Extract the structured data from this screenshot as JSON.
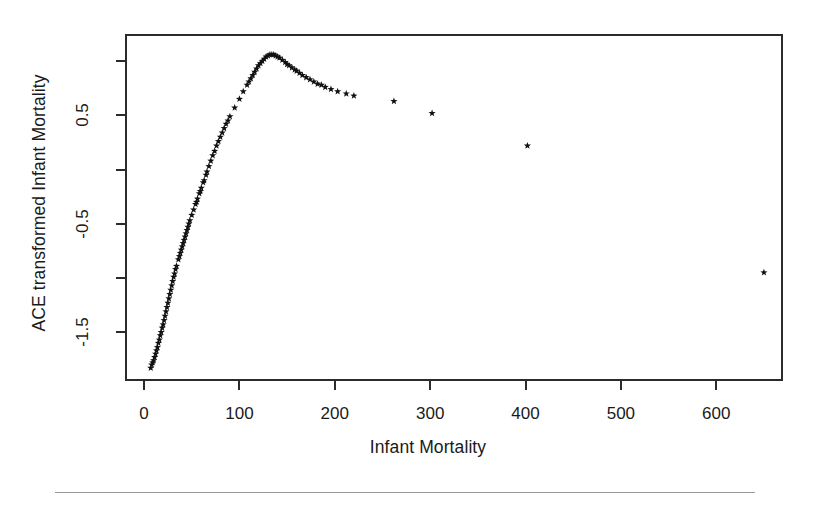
{
  "figure": {
    "background_color": "#ffffff",
    "foreground_color": "#1a1a1a",
    "marker_color": "#111111",
    "footer_rule_color": "#9a9a9a"
  },
  "chart_data": {
    "type": "scatter",
    "title": "",
    "xlabel": "Infant Mortality",
    "ylabel": "ACE transformed Infant Mortality",
    "xlim": [
      -20,
      670
    ],
    "ylim": [
      -1.95,
      1.25
    ],
    "xticks": [
      0,
      100,
      200,
      300,
      400,
      500,
      600
    ],
    "xticklabels": [
      "0",
      "100",
      "200",
      "300",
      "400",
      "500",
      "600"
    ],
    "yticks": [
      -1.5,
      -0.5,
      0.5
    ],
    "yticklabels": [
      "-1.5",
      "-0.5",
      "0.5"
    ],
    "yticks_minor": [
      -1.0,
      0.0,
      1.0
    ],
    "grid": false,
    "legend": null,
    "marker": "star",
    "marker_size": 6,
    "series": [
      {
        "name": "ACE transformed Infant Mortality",
        "x": [
          7,
          8,
          9,
          10,
          11,
          12,
          13,
          14,
          15,
          16,
          17,
          18,
          19,
          20,
          21,
          22,
          23,
          24,
          25,
          26,
          27,
          28,
          29,
          30,
          31,
          32,
          33,
          34,
          36,
          37,
          38,
          39,
          40,
          41,
          42,
          43,
          44,
          45,
          46,
          47,
          48,
          50,
          52,
          54,
          55,
          56,
          58,
          59,
          60,
          62,
          63,
          65,
          66,
          68,
          70,
          72,
          74,
          76,
          78,
          80,
          82,
          84,
          86,
          88,
          90,
          95,
          100,
          104,
          108,
          110,
          112,
          114,
          116,
          118,
          120,
          122,
          124,
          126,
          128,
          130,
          132,
          134,
          136,
          138,
          140,
          142,
          145,
          148,
          150,
          152,
          155,
          158,
          160,
          163,
          166,
          170,
          174,
          178,
          182,
          186,
          190,
          196,
          203,
          212,
          220,
          262,
          302,
          402,
          650
        ],
        "y": [
          -1.83,
          -1.8,
          -1.78,
          -1.76,
          -1.73,
          -1.7,
          -1.67,
          -1.64,
          -1.6,
          -1.57,
          -1.53,
          -1.5,
          -1.46,
          -1.43,
          -1.39,
          -1.35,
          -1.31,
          -1.27,
          -1.23,
          -1.19,
          -1.15,
          -1.11,
          -1.07,
          -1.03,
          -0.99,
          -0.96,
          -0.92,
          -0.89,
          -0.83,
          -0.8,
          -0.77,
          -0.74,
          -0.71,
          -0.68,
          -0.65,
          -0.62,
          -0.59,
          -0.56,
          -0.53,
          -0.5,
          -0.47,
          -0.42,
          -0.37,
          -0.32,
          -0.3,
          -0.27,
          -0.22,
          -0.2,
          -0.17,
          -0.12,
          -0.1,
          -0.05,
          -0.02,
          0.03,
          0.08,
          0.13,
          0.17,
          0.22,
          0.26,
          0.3,
          0.34,
          0.38,
          0.42,
          0.45,
          0.49,
          0.57,
          0.65,
          0.72,
          0.78,
          0.81,
          0.84,
          0.87,
          0.9,
          0.93,
          0.96,
          0.98,
          1.0,
          1.02,
          1.04,
          1.05,
          1.06,
          1.06,
          1.06,
          1.05,
          1.04,
          1.03,
          1.01,
          0.99,
          0.97,
          0.96,
          0.94,
          0.92,
          0.91,
          0.89,
          0.87,
          0.85,
          0.83,
          0.81,
          0.79,
          0.78,
          0.76,
          0.74,
          0.72,
          0.7,
          0.68,
          0.63,
          0.52,
          0.22,
          -0.95
        ]
      }
    ]
  }
}
